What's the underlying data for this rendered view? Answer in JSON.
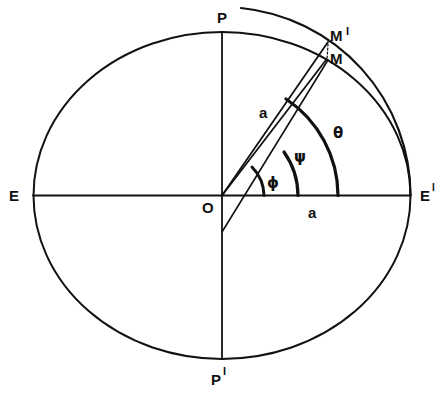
{
  "diagram": {
    "type": "geometry",
    "colors": {
      "ink": "#111111",
      "background": "#ffffff"
    },
    "labels": {
      "north_pole": "P",
      "south_pole": "P",
      "south_pole_prime": "I",
      "east_left": "E",
      "east_right": "E",
      "east_right_prime": "I",
      "origin": "O",
      "point_m_prime": "M",
      "point_m_prime_mark": "I",
      "point_m": "M",
      "semi_axis_radius": "a",
      "semi_axis_horizontal": "a",
      "angle_phi": "ϕ",
      "angle_psi": "ψ",
      "angle_theta": "θ"
    }
  }
}
